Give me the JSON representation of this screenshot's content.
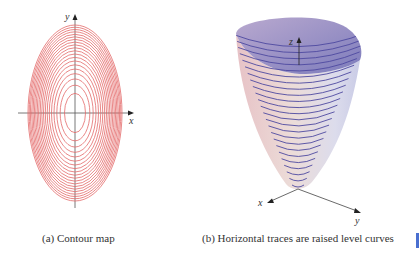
{
  "figure_a": {
    "caption": "(a) Contour map",
    "x_label": "x",
    "y_label": "y",
    "contour_color": "#e36a6a",
    "contour_count": 20
  },
  "figure_b": {
    "caption": "(b) Horizontal traces are raised level curves",
    "x_label": "x",
    "y_label": "y",
    "z_label": "z",
    "level_curve_color": "#4e4aa0"
  },
  "side_tab": {
    "color": "#4a6fd0"
  }
}
